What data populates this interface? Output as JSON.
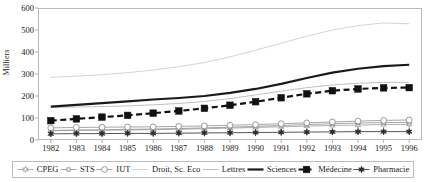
{
  "chart_data": {
    "type": "line",
    "title": "",
    "xlabel": "",
    "ylabel": "Milliers",
    "ylim": [
      0,
      600
    ],
    "ytick_step": 100,
    "yticks": [
      "600",
      "500",
      "400",
      "300",
      "200",
      "100",
      "0"
    ],
    "grid": false,
    "legend_position": "bottom",
    "categories": [
      "1982",
      "1983",
      "1984",
      "1985",
      "1986",
      "1987",
      "1988",
      "1989",
      "1990",
      "1991",
      "1992",
      "1993",
      "1994",
      "1995",
      "1996"
    ],
    "series": [
      {
        "name": "CPEG",
        "marker": "star-open",
        "line": "thin-grey",
        "color": "#9a9a9a",
        "values": [
          42,
          44,
          45,
          46,
          47,
          49,
          51,
          54,
          57,
          60,
          63,
          66,
          68,
          70,
          71
        ]
      },
      {
        "name": "STS",
        "marker": "small-square",
        "line": "thin-grey",
        "color": "#8d8d8d",
        "values": [
          43,
          45,
          46,
          48,
          50,
          52,
          55,
          58,
          62,
          66,
          70,
          74,
          77,
          79,
          80
        ]
      },
      {
        "name": "IUT",
        "marker": "circle-open",
        "line": "thin-grey",
        "color": "#8f8f8f",
        "values": [
          55,
          57,
          58,
          59,
          60,
          62,
          64,
          67,
          70,
          74,
          78,
          82,
          86,
          89,
          91
        ]
      },
      {
        "name": "Droit, Sc. Eco",
        "marker": "none",
        "line": "thin-light",
        "color": "#c8c8c8",
        "values": [
          285,
          290,
          297,
          306,
          318,
          333,
          352,
          378,
          408,
          440,
          472,
          500,
          520,
          532,
          528
        ]
      },
      {
        "name": "Lettres",
        "marker": "none",
        "line": "thin-grey",
        "color": "#b0b0b0",
        "values": [
          148,
          150,
          152,
          155,
          160,
          166,
          175,
          188,
          205,
          222,
          238,
          250,
          258,
          262,
          262
        ]
      },
      {
        "name": "Sciences",
        "marker": "none",
        "line": "thick-black",
        "color": "#1a1a1a",
        "values": [
          152,
          160,
          168,
          176,
          184,
          191,
          200,
          214,
          232,
          255,
          282,
          306,
          324,
          336,
          342
        ]
      },
      {
        "name": "Médecine",
        "marker": "square-filled",
        "line": "dashed-black",
        "color": "#111111",
        "values": [
          88,
          96,
          104,
          112,
          122,
          132,
          144,
          158,
          174,
          192,
          210,
          224,
          232,
          237,
          238
        ]
      },
      {
        "name": "Pharmacie",
        "marker": "star-filled",
        "line": "thin-grey",
        "color": "#2a2a2a",
        "values": [
          28,
          29,
          29,
          30,
          30,
          31,
          32,
          33,
          34,
          35,
          36,
          37,
          38,
          38,
          38
        ]
      }
    ]
  }
}
